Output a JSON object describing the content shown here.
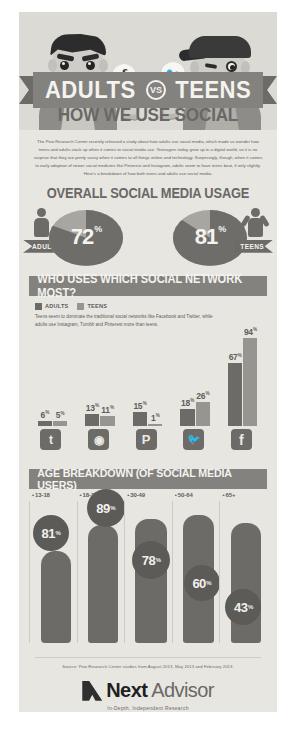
{
  "hero": {
    "adult_bubble": "f",
    "teen_bubble": "🐦",
    "title_left": "ADULTS",
    "title_vs": "VS",
    "title_right": "TEENS",
    "subtitle": "HOW WE USE SOCIAL MEDIA"
  },
  "intro": {
    "paragraph": "The Pew Research Center recently released a study about how adults use social media, which made us wonder how teens and adults stack up when it comes to social media use. Teenagers today grew up in a digital world, so it is no surprise that they are pretty savvy when it comes to all things online and technology. Surprisingly, though, when it comes to early adoption of newer social mediums like Pinterest and Instagram, adults seem to have teens beat, if only slightly. Here's a breakdown of how both teens and adults use social media."
  },
  "overall": {
    "title": "OVERALL SOCIAL MEDIA USAGE",
    "adults_label": "ADULTS",
    "teens_label": "TEENS",
    "adults_value": "72",
    "teens_value": "81",
    "percent_symbol": "%"
  },
  "network": {
    "heading": "WHO USES WHICH SOCIAL NETWORK MOST?",
    "legend": [
      {
        "label": "ADULTS",
        "color": "#6d6b68"
      },
      {
        "label": "TEENS",
        "color": "#97958f"
      }
    ],
    "note": "Teens seem to dominate the traditional social networks like Facebook and Twitter, while adults use Instagram, Tumblr and Pinterest more than teens."
  },
  "age": {
    "heading": "AGE BREAKDOWN (OF SOCIAL MEDIA USERS)"
  },
  "footer": {
    "source": "Source: Pew Research Center studies from August 2013, May 2013 and February 2013.",
    "brand_first": "Next",
    "brand_second": "Advisor",
    "tagline": "In-Depth, Independent Research"
  },
  "chart_data": [
    {
      "type": "pie",
      "title": "OVERALL SOCIAL MEDIA USAGE",
      "labels": [
        "ADULTS",
        "TEENS"
      ],
      "values": [
        72,
        81
      ],
      "unit": "%"
    },
    {
      "type": "bar",
      "title": "WHO USES WHICH SOCIAL NETWORK MOST?",
      "categories": [
        "Tumblr",
        "Instagram",
        "Pinterest",
        "Twitter",
        "Facebook"
      ],
      "category_icons": [
        "tumblr-icon",
        "instagram-icon",
        "pinterest-icon",
        "twitter-icon",
        "facebook-icon"
      ],
      "series": [
        {
          "name": "ADULTS",
          "values": [
            6,
            13,
            15,
            18,
            67
          ],
          "color": "#6d6b68"
        },
        {
          "name": "TEENS",
          "values": [
            5,
            11,
            1,
            26,
            94
          ],
          "color": "#97958f"
        }
      ],
      "unit": "%",
      "ylim": [
        0,
        94
      ],
      "grid": false,
      "legend_position": "top-left"
    },
    {
      "type": "bar",
      "title": "AGE BREAKDOWN (OF SOCIAL MEDIA USERS)",
      "categories": [
        "13-18",
        "18-29",
        "30-49",
        "50-64",
        "65+"
      ],
      "values": [
        81,
        89,
        78,
        60,
        43
      ],
      "unit": "%",
      "ylim": [
        0,
        100
      ],
      "grid": false
    }
  ]
}
